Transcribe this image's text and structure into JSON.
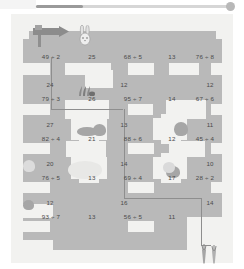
{
  "app": {
    "title": "Division Maze Worksheet",
    "slider": {
      "value_pct": 24,
      "name": "zoom-slider"
    }
  },
  "worksheet": {
    "theme": "rabbit-carrot division maze",
    "start_marker": "signpost-arrow",
    "character": "rabbit",
    "goal": "carrots",
    "rows": [
      {
        "row": 1,
        "cells": [
          "49 ÷ 2",
          "25",
          "68 ÷ 5",
          "13",
          "76 ÷ 8"
        ]
      },
      {
        "row": 2,
        "cells": [
          "79 ÷ 3",
          "26",
          "95 ÷ 7",
          "14",
          "67 ÷ 6"
        ]
      },
      {
        "row": 3,
        "cells": [
          "82 ÷ 4",
          "21",
          "88 ÷ 6",
          "12",
          "45 ÷ 4"
        ]
      },
      {
        "row": 4,
        "cells": [
          "76 ÷ 5",
          "13",
          "69 ÷ 4",
          "17",
          "28 ÷ 2"
        ]
      },
      {
        "row": 5,
        "cells": [
          "93 ÷ 7",
          "13",
          "56 ÷ 5",
          "11",
          ""
        ]
      }
    ],
    "connectors": {
      "col1": [
        "24",
        "27",
        "20",
        "12"
      ],
      "col3": [
        "12",
        "13",
        "14",
        "16"
      ],
      "col5": [
        "12",
        "11",
        "10",
        "14"
      ]
    }
  },
  "colors": {
    "page": "#ffffff",
    "sheet": "#f2f2f0",
    "maze_grey": "#b9b9b9",
    "path_light": "#f2f2f0",
    "text": "#4a4a4a",
    "slider_fill": "#9a9a9a",
    "slider_track": "#d6d6d6"
  }
}
